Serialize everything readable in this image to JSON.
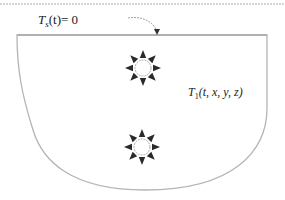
{
  "diagram": {
    "boundary_label": {
      "symbol": "T",
      "subscript": "s",
      "rest": "(t)= 0"
    },
    "domain_label": {
      "symbol": "T",
      "subscript": "1",
      "rest": "(t, x, y, z)"
    },
    "sources": [
      {
        "name": "heat-source-upper",
        "type": "point-heat-source",
        "arrows": 8
      },
      {
        "name": "heat-source-lower",
        "type": "point-heat-source",
        "arrows": 8
      }
    ],
    "colors": {
      "outline": "#b5b5b5",
      "arrow": "#2a2a2a",
      "text": "#222222"
    }
  }
}
